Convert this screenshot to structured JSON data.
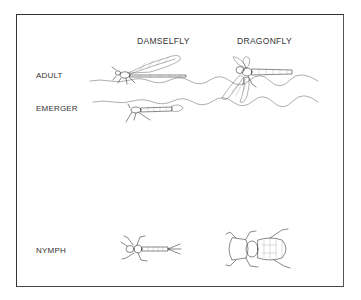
{
  "diagram": {
    "columns": [
      {
        "id": "damselfly",
        "label": "DAMSELFLY"
      },
      {
        "id": "dragonfly",
        "label": "DRAGONFLY"
      }
    ],
    "rows": [
      {
        "id": "adult",
        "label": "ADULT"
      },
      {
        "id": "emerger",
        "label": "EMERGER"
      },
      {
        "id": "nymph",
        "label": "NYMPH"
      }
    ],
    "illustrations": [
      {
        "row": "adult",
        "column": "damselfly",
        "description": "adult damselfly resting on water surface, wings folded along abdomen"
      },
      {
        "row": "adult",
        "column": "dragonfly",
        "description": "adult dragonfly with wings spread, perched at water surface"
      },
      {
        "row": "emerger",
        "column": "damselfly",
        "description": "emerging damselfly below the surface film"
      },
      {
        "row": "nymph",
        "column": "damselfly",
        "description": "slender damselfly nymph with three tail gills"
      },
      {
        "row": "nymph",
        "column": "dragonfly",
        "description": "stout, broad dragonfly nymph"
      }
    ],
    "water_lines": 2
  }
}
